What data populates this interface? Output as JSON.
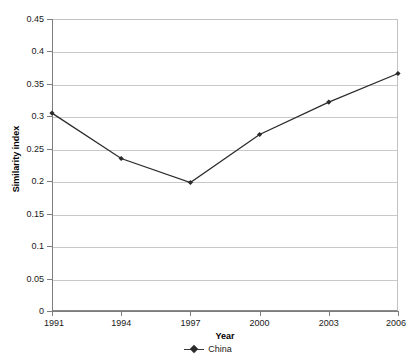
{
  "top_remnant_text": "· · ·",
  "chart_data": {
    "type": "line",
    "title": "",
    "subtitle": "",
    "xlabel": "Year",
    "ylabel": "Similarity index",
    "categories": [
      "1991",
      "1994",
      "1997",
      "2000",
      "2003",
      "2006"
    ],
    "series": [
      {
        "name": "China",
        "values": [
          0.305,
          0.235,
          0.198,
          0.272,
          0.322,
          0.366
        ],
        "color": "#2b2b2b",
        "marker": "diamond"
      }
    ],
    "ylim": [
      0,
      0.45
    ],
    "ytick_step": 0.05,
    "ytick_labels": [
      "0",
      "0.05",
      "0.1",
      "0.15",
      "0.2",
      "0.25",
      "0.3",
      "0.35",
      "0.4",
      "0.45"
    ],
    "ytick_values": [
      0,
      0.05,
      0.1,
      0.15,
      0.2,
      0.25,
      0.3,
      0.35,
      0.4,
      0.45
    ],
    "xtick_labels": [
      "1991",
      "1994",
      "1997",
      "2000",
      "2003",
      "2006"
    ],
    "grid": "horizontal",
    "legend_position": "bottom",
    "legend_entries": [
      "China"
    ],
    "plot_background": "#ffffff",
    "gridline_color": "#c9c9c9",
    "axis_color": "#7d7d7d"
  },
  "axis": {
    "y_title": "Similarity index",
    "x_title": "Year"
  },
  "legend": {
    "china_label": "China"
  }
}
